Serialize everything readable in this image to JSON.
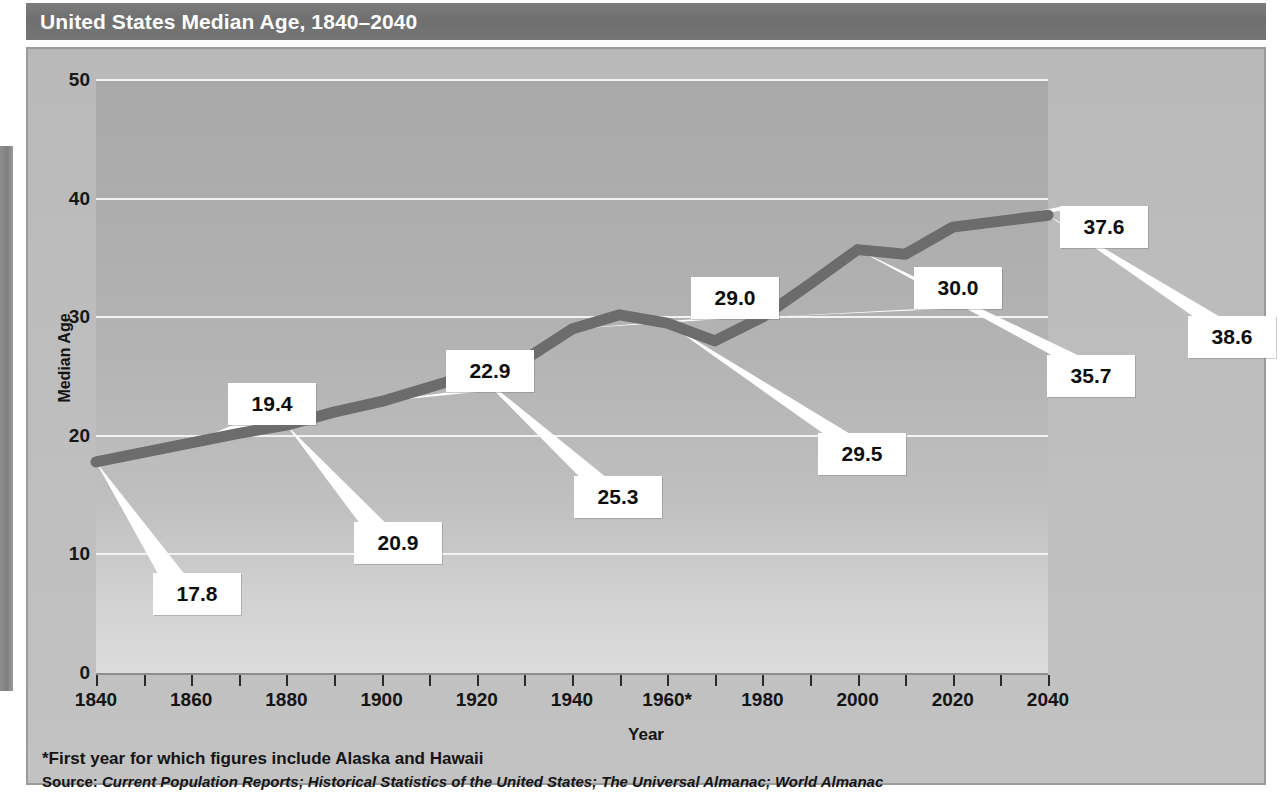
{
  "title": "United States Median Age, 1840–2040",
  "axis": {
    "y_title": "Median Age",
    "x_title": "Year",
    "y_ticks": [
      "50",
      "40",
      "30",
      "20",
      "10",
      "0"
    ],
    "x_ticks": [
      "1840",
      "1860",
      "1880",
      "1900",
      "1920",
      "1940",
      "1960*",
      "1980",
      "2000",
      "2020",
      "2040"
    ]
  },
  "footnote": "*First year for which figures include Alaska and Hawaii",
  "source": {
    "label": "Source: ",
    "text": "Current Population Reports; Historical Statistics of the United States; The Universal Almanac; World Almanac"
  },
  "callouts": [
    {
      "label": "17.8",
      "x": 125,
      "y": 524,
      "w": 88,
      "h": 42
    },
    {
      "label": "19.4",
      "x": 200,
      "y": 334,
      "w": 88,
      "h": 42
    },
    {
      "label": "20.9",
      "x": 326,
      "y": 473,
      "w": 88,
      "h": 42
    },
    {
      "label": "22.9",
      "x": 418,
      "y": 301,
      "w": 88,
      "h": 42
    },
    {
      "label": "25.3",
      "x": 546,
      "y": 427,
      "w": 88,
      "h": 42
    },
    {
      "label": "29.0",
      "x": 663,
      "y": 228,
      "w": 88,
      "h": 42
    },
    {
      "label": "29.5",
      "x": 790,
      "y": 384,
      "w": 88,
      "h": 42
    },
    {
      "label": "30.0",
      "x": 886,
      "y": 218,
      "w": 88,
      "h": 42
    },
    {
      "label": "35.7",
      "x": 1019,
      "y": 306,
      "w": 88,
      "h": 42
    },
    {
      "label": "37.6",
      "x": 1032,
      "y": 157,
      "w": 88,
      "h": 42
    },
    {
      "label": "38.6",
      "x": 1160,
      "y": 267,
      "w": 88,
      "h": 42
    }
  ],
  "colors": {
    "banner": "#737373",
    "panel": "#bdbdbd",
    "line": "#6c6c6c",
    "gridline": "#f2f2f2",
    "callout_bg": "#ffffff",
    "text": "#141414",
    "title_text": "#ffffff"
  },
  "chart_data": {
    "type": "line",
    "title": "United States Median Age, 1840–2040",
    "xlabel": "Year",
    "ylabel": "Median Age",
    "xlim": [
      1840,
      2040
    ],
    "ylim": [
      0,
      50
    ],
    "grid": true,
    "legend": "none",
    "x": [
      1840,
      1850,
      1860,
      1870,
      1880,
      1890,
      1900,
      1910,
      1920,
      1930,
      1940,
      1950,
      1960,
      1970,
      1980,
      1990,
      2000,
      2010,
      2020,
      2030,
      2040
    ],
    "values": [
      17.8,
      18.6,
      19.4,
      20.2,
      20.9,
      22.0,
      22.9,
      24.1,
      25.3,
      26.4,
      29.0,
      30.2,
      29.5,
      28.0,
      30.0,
      32.8,
      35.7,
      35.3,
      37.6,
      38.1,
      38.6
    ],
    "labeled_points": [
      {
        "year": 1840,
        "value": 17.8
      },
      {
        "year": 1860,
        "value": 19.4
      },
      {
        "year": 1880,
        "value": 20.9
      },
      {
        "year": 1900,
        "value": 22.9
      },
      {
        "year": 1920,
        "value": 25.3
      },
      {
        "year": 1940,
        "value": 29.0
      },
      {
        "year": 1960,
        "value": 29.5
      },
      {
        "year": 1980,
        "value": 30.0
      },
      {
        "year": 2000,
        "value": 35.7
      },
      {
        "year": 2020,
        "value": 37.6
      },
      {
        "year": 2040,
        "value": 38.6
      }
    ],
    "annotations": [
      "*First year for which figures include Alaska and Hawaii",
      "Source: Current Population Reports; Historical Statistics of the United States; The Universal Almanac; World Almanac"
    ]
  }
}
